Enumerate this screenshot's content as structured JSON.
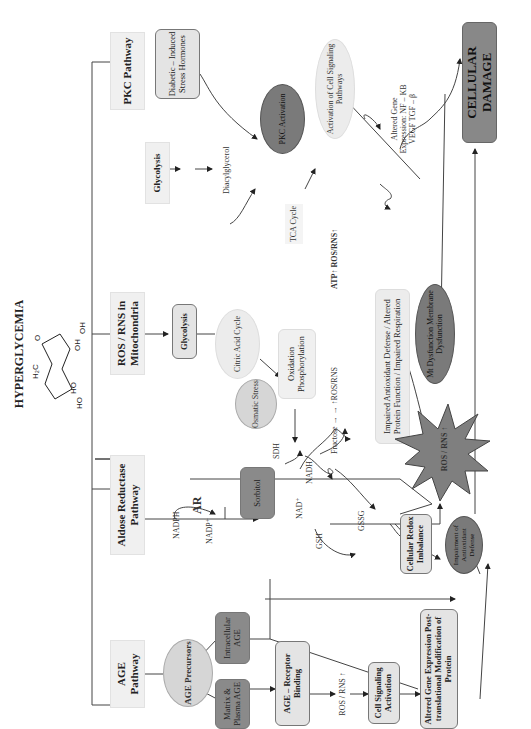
{
  "title": "HYPERGLYCEMIA",
  "molecule": {
    "name": "glucose-structure",
    "labels": [
      "H2C",
      "O",
      "OH",
      "OH",
      "HO",
      "HO"
    ]
  },
  "pathways": [
    {
      "id": "age",
      "label": "AGE Pathway"
    },
    {
      "id": "aldose",
      "label": "Aldose Reductase Pathway"
    },
    {
      "id": "mito",
      "label": "ROS / RNS in Mitochondria"
    },
    {
      "id": "glycolysis_pkc",
      "label": "Glycolysis"
    },
    {
      "id": "pkc",
      "label": "PKC Pathway"
    }
  ],
  "nodes": {
    "age_precursors": "AGE Precursors",
    "intracellular_age": "Intracellular AGE",
    "matrix_plasma_age": "Matrix & Plasma AGE",
    "age_receptor_binding": "AGE – Receptor Binding",
    "ros_rns_age": "ROS / RNS ↑",
    "cell_signaling_activation": "Cell Signaling Activation",
    "altered_gene_expression": "Altered Gene Expression Post-translational Modification of Protein",
    "nadph": "NADPH",
    "nadp": "NADP⁺",
    "ar": "AR",
    "sorbitol": "Sorbitol",
    "osmotic_stress": "Osmatic Stress",
    "sdh": "SDH",
    "nad": "NAD⁺",
    "nadh": "NADH",
    "fructose": "Fructose → → ↑ROS/RNS",
    "gsh": "GSH",
    "gssg": "GSSG",
    "cellular_redox": "Cellular Redox Imbalance",
    "impairment_antioxidant": "Impairment of Antioxidant Defense",
    "glycolysis_mito": "Glycolysis",
    "citric_acid_cycle": "Citric Acid Cycle",
    "oxidation_phosphorylation": "Oxidation Phosphorylation",
    "tca_cycle": "TCA Cycle",
    "atp_ros": "ATP↑ ROS/RNS↑",
    "impaired_defense": "Impaired Antioxidant Defense / Altered Protein Function / Impaired Respiration",
    "mt_dysfunction": "Mt Dysfunction Membrane Dysfunction",
    "ros_rns_star": "ROS / RNS ↑",
    "diacylglycerol": "Diacylglycerol",
    "stress_hormones": "Diabetic – Induced Stress Hormones",
    "pkc_activation": "PKC Activation",
    "activation_cell_signaling": "Activation of Cell Signaling Pathways",
    "altered_gene_expr_pkc": "Altered Gene Expression: NF – KB VEGF TGF – β",
    "cellular_damage": "CELLULAR DAMAGE"
  },
  "colors": {
    "pathway_box": "#f0f0f0",
    "light_node": "#e4e4e4",
    "dark_node": "#8a8a8a",
    "star": "#7f7f7f",
    "damage": "#888888",
    "line": "#333333"
  }
}
